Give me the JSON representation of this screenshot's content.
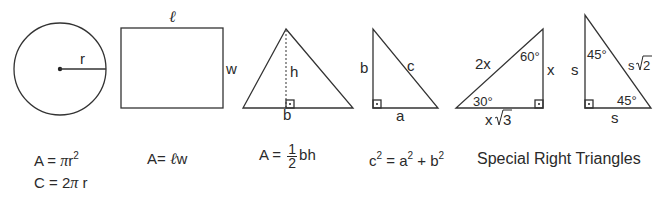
{
  "figures": {
    "circle": {
      "radius_label": "r"
    },
    "rectangle": {
      "length_label": "ℓ",
      "width_label": "w"
    },
    "triangle": {
      "height_label": "h",
      "base_label": "b"
    },
    "right_triangle": {
      "leg_vertical_label": "b",
      "hypotenuse_label": "c",
      "leg_horizontal_label": "a"
    },
    "triangle_30_60_90": {
      "hypotenuse_label": "2x",
      "angle_top_label": "60°",
      "short_leg_label": "x",
      "angle_left_label": "30°",
      "long_leg_prefix": "x",
      "long_leg_radicand": "3"
    },
    "triangle_45_45_90": {
      "angle_top_label": "45°",
      "leg_vertical_label": "s",
      "hypotenuse_prefix": "s",
      "hypotenuse_radicand": "2",
      "angle_bottom_label": "45°",
      "leg_horizontal_label": "s"
    }
  },
  "formulas": {
    "circle_area": {
      "lhs": "A = ",
      "pi": "π",
      "var": "r",
      "exp": "2"
    },
    "circle_circumference": {
      "lhs": "C = 2",
      "pi": "π",
      "var": " r"
    },
    "rectangle_area": {
      "lhs": "A= ",
      "ell": "ℓ",
      "var": "w"
    },
    "triangle_area": {
      "lhs": "A = ",
      "numerator": "1",
      "denominator": "2",
      "rhs": "bh"
    },
    "pythagorean": {
      "c": "c",
      "c_exp": "2",
      "eq": " = a",
      "a_exp": "2",
      "plus": " + b",
      "b_exp": "2"
    }
  },
  "heading": "Special Right Triangles"
}
